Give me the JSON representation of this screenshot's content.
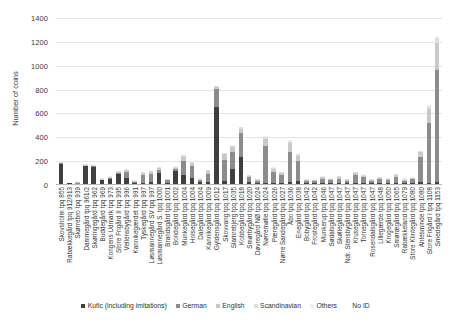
{
  "chart_data": {
    "type": "bar",
    "subtype": "stacked-vertical",
    "title": "",
    "xlabel": "",
    "ylabel": "Number of coins",
    "ylim": [
      0,
      1400
    ],
    "yticks": [
      0,
      200,
      400,
      600,
      800,
      1000,
      1200,
      1400
    ],
    "grid": "horizontal",
    "legend_position": "bottom",
    "categories": [
      "Skovsholm tpq 855",
      "Rabækkegård tpq 912/913",
      "Skørrebro tpq 939",
      "Dammegård tpq 961/2",
      "Skøringegård tpq 962",
      "Buddegård tpq 969",
      "Kongens Udmark tpq 973",
      "Store Frigård II tpq 995",
      "Vellensbygård tpq 996",
      "Kannikegærdet tpq 991",
      "Tyskegård tpq 997",
      "Løsmannegård SV tpq 997",
      "Løsmannegård S. tpq 1000",
      "Brandsgård tpq 1001",
      "Bondegård tpq 1002",
      "Munkegård tpq 1004",
      "Holsegård tpq 1004",
      "Dalegård tpq 1004",
      "Kannikegård tpq 1009",
      "Gyldensgård tpq 1012",
      "Skovvang tpq 1017",
      "Slamrebjerg tpq 1035",
      "Kobbegård tpq 1018",
      "Smørbygård tpq 1020",
      "Døvregård NØ tpq 1024",
      "Nørremølle tpq 1024",
      "Pæregård tpq 1026",
      "Nørre Sandegård tpq 1027",
      "Åbo tpq 1036",
      "Enegård tpq 1038",
      "Bobygård tpq 1042",
      "Frostegård tpq 1042",
      "Munkerup tpq 1046",
      "Sødalsgård tpq 1047",
      "Skøllegård tpq 1047",
      "Ndr. Stensbygård tpq 1047",
      "Krusegård tpq 1047",
      "Tornegård tpq 1047",
      "Rosendalsgård tpq 1047",
      "Lillegærde tpq 1048",
      "Krogegård tpq 1050",
      "Smørægård tpq 1065",
      "Rabækkeland tpq 1079",
      "Store Klintegård tpq 1080",
      "Ahlesminde tpq 1080",
      "Store Frigård I tpq 1108",
      "Smedegård tpq 1153"
    ],
    "series": [
      {
        "name": "Kufic (including imitations)",
        "color": "#3f3f3f",
        "values": [
          168,
          12,
          0,
          150,
          143,
          30,
          44,
          85,
          52,
          12,
          10,
          20,
          90,
          8,
          112,
          72,
          52,
          18,
          14,
          644,
          25,
          130,
          230,
          18,
          6,
          10,
          12,
          8,
          18,
          26,
          6,
          10,
          8,
          6,
          4,
          6,
          12,
          8,
          6,
          10,
          8,
          6,
          4,
          8,
          18,
          10,
          14
        ]
      },
      {
        "name": "German",
        "color": "#8c8c8c",
        "values": [
          6,
          0,
          8,
          4,
          3,
          4,
          6,
          10,
          48,
          6,
          65,
          62,
          30,
          22,
          18,
          120,
          98,
          14,
          70,
          150,
          180,
          140,
          195,
          38,
          22,
          310,
          88,
          66,
          248,
          168,
          20,
          16,
          36,
          24,
          40,
          22,
          62,
          48,
          20,
          30,
          26,
          56,
          24,
          30,
          206,
          500,
          945
        ]
      },
      {
        "name": "English",
        "color": "#c9c9c9",
        "values": [
          2,
          0,
          2,
          2,
          2,
          2,
          4,
          6,
          14,
          3,
          18,
          22,
          14,
          6,
          8,
          38,
          30,
          6,
          26,
          20,
          44,
          42,
          40,
          12,
          8,
          60,
          28,
          18,
          78,
          44,
          8,
          6,
          12,
          8,
          14,
          8,
          18,
          14,
          8,
          10,
          8,
          16,
          8,
          10,
          42,
          118,
          226
        ]
      },
      {
        "name": "Scandinavian",
        "color": "#dedede",
        "values": [
          1,
          0,
          1,
          1,
          1,
          1,
          1,
          2,
          4,
          1,
          5,
          6,
          4,
          2,
          2,
          10,
          8,
          2,
          6,
          5,
          10,
          10,
          10,
          4,
          2,
          14,
          8,
          4,
          18,
          10,
          2,
          2,
          3,
          2,
          4,
          2,
          4,
          4,
          2,
          3,
          2,
          4,
          2,
          3,
          10,
          28,
          40
        ]
      },
      {
        "name": "Others",
        "color": "#f0f0f0",
        "values": [
          1,
          0,
          1,
          1,
          1,
          1,
          1,
          1,
          2,
          1,
          2,
          3,
          2,
          1,
          1,
          4,
          4,
          1,
          3,
          2,
          4,
          4,
          4,
          2,
          1,
          6,
          3,
          2,
          6,
          4,
          1,
          1,
          1,
          1,
          2,
          1,
          2,
          2,
          1,
          1,
          1,
          2,
          1,
          1,
          4,
          10,
          14
        ]
      },
      {
        "name": "No ID",
        "color": "#ffffff",
        "values": [
          0,
          0,
          0,
          0,
          0,
          0,
          0,
          0,
          0,
          0,
          0,
          0,
          0,
          0,
          0,
          0,
          0,
          0,
          0,
          0,
          0,
          0,
          0,
          0,
          0,
          0,
          0,
          0,
          0,
          0,
          0,
          0,
          0,
          0,
          0,
          0,
          0,
          0,
          0,
          0,
          0,
          0,
          0,
          0,
          0,
          0,
          0
        ]
      }
    ],
    "legend": [
      {
        "label": "Kufic (including imitations)",
        "color": "#3f3f3f"
      },
      {
        "label": "German",
        "color": "#8c8c8c"
      },
      {
        "label": "English",
        "color": "#c9c9c9"
      },
      {
        "label": "Scandinavian",
        "color": "#dedede"
      },
      {
        "label": "Others",
        "color": "#f0f0f0"
      },
      {
        "label": "No ID",
        "color": "#ffffff"
      }
    ]
  }
}
